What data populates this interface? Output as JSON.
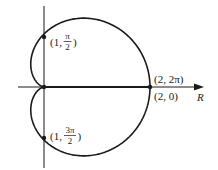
{
  "diagram": {
    "type": "polar-curve",
    "axis_label": "R",
    "points": [
      {
        "id": "p1",
        "label_r": "1",
        "label_theta_num": "π",
        "label_theta_den": "2"
      },
      {
        "id": "p2",
        "label_r": "1",
        "label_theta_num": "3π",
        "label_theta_den": "2"
      },
      {
        "id": "p3",
        "label": "(2, 2π)"
      },
      {
        "id": "p4",
        "label": "(2, 0)"
      }
    ],
    "colors": {
      "stroke": "#1a1a1a",
      "background": "#ffffff"
    }
  }
}
